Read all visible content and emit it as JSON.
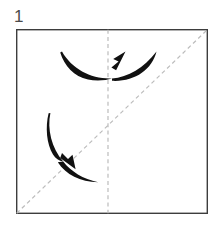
{
  "figure": {
    "kind": "origami-step-diagram",
    "step_label": "1",
    "canvas": {
      "width": 214,
      "height": 226,
      "background": "#ffffff"
    },
    "colors": {
      "paper_outline": "#3d3d3d",
      "paper_fill": "#ffffff",
      "crease_dashed": "#bcbcbc",
      "arrow": "#111111",
      "step_number": "#4a4a4a"
    },
    "paper": {
      "name": "square-sheet",
      "shape": "square",
      "left": 16,
      "top": 29,
      "right": 208,
      "bottom": 214,
      "outline_width": 1.4
    },
    "creases": [
      {
        "name": "vertical-crease",
        "style": "dashed",
        "orientation": "vertical",
        "x1": 108,
        "y1": 29,
        "x2": 108,
        "y2": 214
      },
      {
        "name": "diagonal-crease",
        "style": "dashed",
        "orientation": "diagonal",
        "x1": 16,
        "y1": 214,
        "x2": 208,
        "y2": 29
      }
    ],
    "arrows": [
      {
        "name": "upper-fold-arrow",
        "direction": "up-right",
        "description": "curved crescent arrow sweeping left to right across the vertical crease",
        "tail": {
          "x": 62,
          "y": 52
        },
        "head": {
          "x": 124,
          "y": 56
        },
        "outer_end": {
          "x": 156,
          "y": 52
        }
      },
      {
        "name": "lower-fold-arrow",
        "direction": "down-right",
        "description": "curved crescent arrow sweeping downward across the diagonal crease",
        "tail": {
          "x": 50,
          "y": 113
        },
        "head": {
          "x": 72,
          "y": 166
        },
        "outer_end": {
          "x": 98,
          "y": 182
        }
      }
    ]
  }
}
